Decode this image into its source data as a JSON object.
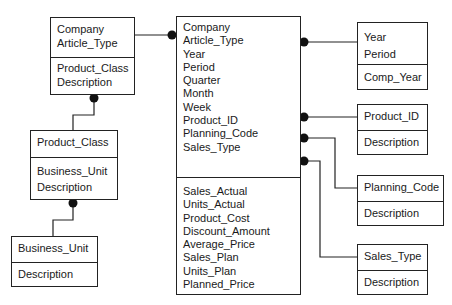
{
  "diagram": {
    "type": "star-schema",
    "fact_table": {
      "keys": [
        "Company",
        "Article_Type",
        "Year",
        "Period",
        "Quarter",
        "Month",
        "Week",
        "Product_ID",
        "Planning_Code",
        "Sales_Type"
      ],
      "measures": [
        "Sales_Actual",
        "Units_Actual",
        "Product_Cost",
        "Discount_Amount",
        "Average_Price",
        "Sales_Plan",
        "Units_Plan",
        "Planned_Price"
      ]
    },
    "dimensions": {
      "article_type": {
        "keys": [
          "Company",
          "Article_Type"
        ],
        "attributes": [
          "Product_Class",
          "Description"
        ]
      },
      "product_class": {
        "keys": [
          "Product_Class"
        ],
        "attributes": [
          "Business_Unit",
          "Description"
        ]
      },
      "business_unit": {
        "keys": [
          "Business_Unit"
        ],
        "attributes": [
          "Description"
        ]
      },
      "period": {
        "keys": [
          "Year",
          "Period"
        ],
        "attributes": [
          "Comp_Year"
        ]
      },
      "product": {
        "keys": [
          "Product_ID"
        ],
        "attributes": [
          "Description"
        ]
      },
      "planning_code": {
        "keys": [
          "Planning_Code"
        ],
        "attributes": [
          "Description"
        ]
      },
      "sales_type": {
        "keys": [
          "Sales_Type"
        ],
        "attributes": [
          "Description"
        ]
      }
    },
    "relationships": [
      {
        "from": "article_type",
        "to": "fact_table",
        "many_end": "fact_table"
      },
      {
        "from": "product_class",
        "to": "article_type",
        "many_end": "article_type"
      },
      {
        "from": "business_unit",
        "to": "product_class",
        "many_end": "product_class"
      },
      {
        "from": "period",
        "to": "fact_table",
        "many_end": "fact_table"
      },
      {
        "from": "product",
        "to": "fact_table",
        "many_end": "fact_table"
      },
      {
        "from": "planning_code",
        "to": "fact_table",
        "many_end": "fact_table"
      },
      {
        "from": "sales_type",
        "to": "fact_table",
        "many_end": "fact_table"
      }
    ],
    "colors": {
      "line": "#222222",
      "background": "#ffffff",
      "text": "#1a1a1a"
    }
  }
}
